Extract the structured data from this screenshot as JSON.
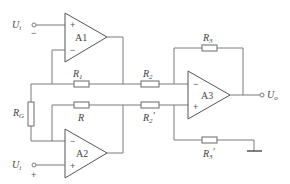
{
  "diagram": {
    "type": "circuit",
    "title": "",
    "amplifiers": [
      {
        "id": "A1",
        "label": "A1",
        "inputs": {
          "plus": "U_i-",
          "minus": "R1 / RG node"
        }
      },
      {
        "id": "A2",
        "label": "A2",
        "inputs": {
          "minus": "R / RG node",
          "plus": "U_i+"
        }
      },
      {
        "id": "A3",
        "label": "A3",
        "inputs": {
          "minus": "R2 / R3 node",
          "plus": "R2' / R3' node"
        }
      }
    ],
    "resistors": [
      {
        "id": "R1",
        "label": "R",
        "sub": "1",
        "prime": ""
      },
      {
        "id": "R",
        "label": "R",
        "sub": "",
        "prime": ""
      },
      {
        "id": "RG",
        "label": "R",
        "sub": "G",
        "prime": ""
      },
      {
        "id": "R2",
        "label": "R",
        "sub": "2",
        "prime": ""
      },
      {
        "id": "R2p",
        "label": "R",
        "sub": "2",
        "prime": "′"
      },
      {
        "id": "R3",
        "label": "R",
        "sub": "3",
        "prime": ""
      },
      {
        "id": "R3p",
        "label": "R",
        "sub": "3",
        "prime": "′"
      }
    ],
    "terminals": {
      "input_minus": {
        "label": "U",
        "sub": "i",
        "sign": "−"
      },
      "input_plus": {
        "label": "U",
        "sub": "i",
        "sign": "+"
      },
      "output": {
        "label": "U",
        "sub": "o"
      }
    },
    "signs": {
      "plus": "+",
      "minus": "−"
    },
    "ground": "ground-symbol"
  }
}
